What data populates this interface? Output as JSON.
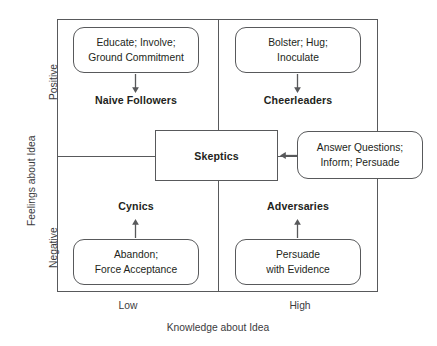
{
  "diagram": {
    "axes": {
      "x": {
        "label": "Knowledge about Idea",
        "ticks": [
          "Low",
          "High"
        ]
      },
      "y": {
        "label": "Feelings about Idea",
        "ticks": [
          "Positive",
          "Negative"
        ]
      }
    },
    "center": {
      "label": "Skeptics"
    },
    "quadrants": [
      {
        "key": "naive-followers",
        "label": "Naive Followers",
        "action_lines": [
          "Educate; Involve;",
          "Ground Commitment"
        ],
        "arrow": "down"
      },
      {
        "key": "cheerleaders",
        "label": "Cheerleaders",
        "action_lines": [
          "Bolster; Hug;",
          "Inoculate"
        ],
        "arrow": "down"
      },
      {
        "key": "cynics",
        "label": "Cynics",
        "action_lines": [
          "Abandon;",
          "Force Acceptance"
        ],
        "arrow": "up"
      },
      {
        "key": "adversaries",
        "label": "Adversaries",
        "action_lines": [
          "Persuade",
          "with Evidence"
        ],
        "arrow": "up"
      }
    ],
    "center_action": {
      "key": "skeptics-action",
      "action_lines": [
        "Answer Questions;",
        "Inform; Persuade"
      ],
      "arrow": "left"
    },
    "colors": {
      "line": "#58595b",
      "text": "#231f20",
      "axis_text": "#3b3b3d",
      "background": "#ffffff"
    }
  }
}
